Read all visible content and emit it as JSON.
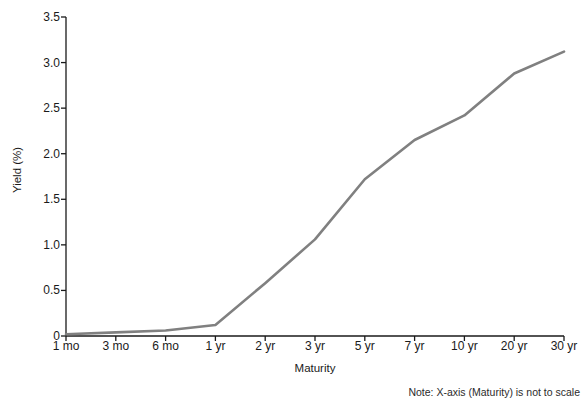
{
  "chart_data": {
    "type": "line",
    "title": "",
    "xlabel": "Maturity",
    "ylabel": "Yield (%)",
    "categories": [
      "1 mo",
      "3 mo",
      "6 mo",
      "1 yr",
      "2 yr",
      "3 yr",
      "5 yr",
      "7 yr",
      "10 yr",
      "20 yr",
      "30 yr"
    ],
    "values": [
      0.02,
      0.04,
      0.06,
      0.12,
      0.58,
      1.06,
      1.72,
      2.15,
      2.42,
      2.88,
      3.12
    ],
    "ylim": [
      0,
      3.5
    ],
    "ytick_labels": [
      "0",
      "0.5",
      "1.0",
      "1.5",
      "2.0",
      "2.5",
      "3.0",
      "3.5"
    ],
    "ytick_values": [
      0,
      0.5,
      1.0,
      1.5,
      2.0,
      2.5,
      3.0,
      3.5
    ],
    "grid": false,
    "legend": false,
    "legend_position": "none",
    "line_color": "#808080",
    "axis_color": "#1a1a1a",
    "markers": false,
    "annotations": [
      {
        "name": "x-axis-scale-note",
        "text": "Note: X-axis (Maturity) is not to scale",
        "position": "bottom-right"
      }
    ]
  }
}
